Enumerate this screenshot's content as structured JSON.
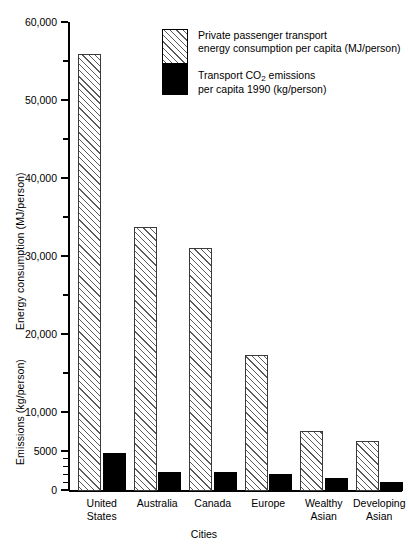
{
  "chart_data": {
    "type": "bar",
    "title": "",
    "xlabel": "Cities",
    "ylabel_primary": "Energy consumption (MJ/person)",
    "ylabel_secondary": "Emissions (kg/person)",
    "categories": [
      "United States",
      "Australia",
      "Canada",
      "Europe",
      "Wealthy Asian",
      "Developing Asian"
    ],
    "category_lines": [
      [
        "United",
        "States"
      ],
      [
        "Australia",
        ""
      ],
      [
        "Canada",
        ""
      ],
      [
        "Europe",
        ""
      ],
      [
        "Wealthy",
        "Asian"
      ],
      [
        "Developing",
        "Asian"
      ]
    ],
    "series": [
      {
        "name": "Private passenger transport energy consumption per capita (MJ/person)",
        "legend_lines": [
          "Private passenger transport",
          "energy consumption per capita (MJ/person)"
        ],
        "pattern": "diagonal-hatch",
        "values": [
          56000,
          33900,
          31100,
          17500,
          7700,
          6400
        ]
      },
      {
        "name": "Transport CO2 emissions per capita 1990 (kg/person)",
        "legend_lines": [
          "Transport CO",
          "2",
          " emissions",
          "per capita 1990 (kg/person)"
        ],
        "pattern": "solid-black",
        "values": [
          4900,
          2500,
          2500,
          2200,
          1700,
          1100
        ]
      }
    ],
    "ylim": [
      0,
      60000
    ],
    "major_ticks": [
      0,
      5000,
      10000,
      20000,
      30000,
      40000,
      50000,
      60000
    ],
    "tick_labels": [
      "0",
      "5000",
      "10,000",
      "20,000",
      "30,000",
      "40,000",
      "50,000",
      "60,000"
    ],
    "minor_ticks": [
      1000,
      2000,
      3000,
      4000,
      15000,
      25000,
      35000,
      45000,
      55000
    ],
    "grid": false,
    "legend_position": "top-center"
  },
  "axis": {
    "xlabel": "Cities",
    "ylabel_energy": "Energy consumption (MJ/person)",
    "ylabel_emissions": "Emissions (kg/person)"
  },
  "legend": {
    "energy_line1": "Private passenger transport",
    "energy_line2": "energy consumption per capita (MJ/person)",
    "emissions_line1_a": "Transport CO",
    "emissions_line1_sub": "2",
    "emissions_line1_b": " emissions",
    "emissions_line2": "per capita 1990 (kg/person)"
  },
  "ticks": {
    "t0": "0",
    "t5000": "5000",
    "t10000": "10,000",
    "t20000": "20,000",
    "t30000": "30,000",
    "t40000": "40,000",
    "t50000": "50,000",
    "t60000": "60,000"
  },
  "categories": {
    "c0a": "United",
    "c0b": "States",
    "c1a": "Australia",
    "c1b": "",
    "c2a": "Canada",
    "c2b": "",
    "c3a": "Europe",
    "c3b": "",
    "c4a": "Wealthy",
    "c4b": "Asian",
    "c5a": "Developing",
    "c5b": "Asian"
  }
}
